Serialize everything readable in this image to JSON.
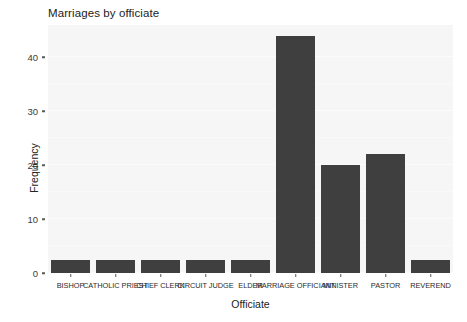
{
  "chart_data": {
    "type": "bar",
    "title": "Marriages by officiate",
    "xlabel": "Officiate",
    "ylabel": "Frequency",
    "categories": [
      "BISHOP",
      "CATHOLIC PRIEST",
      "CHIEF CLERK",
      "CIRCUIT JUDGE",
      "ELDER",
      "MARRIAGE OFFICIANT",
      "MINISTER",
      "PASTOR",
      "REVEREND"
    ],
    "values": [
      2.5,
      2.5,
      2.5,
      2.5,
      2.5,
      44,
      20,
      22,
      2.5
    ],
    "ylim": [
      0,
      46
    ],
    "ytick_values": [
      0,
      10,
      20,
      30,
      40
    ],
    "ytick_labels": [
      "0",
      "10",
      "20",
      "30",
      "40"
    ],
    "grid": true,
    "legend": "none",
    "bar_color": "#3f3f3f",
    "panel_color": "#f6f6f6",
    "page_color": "#ffffff"
  }
}
